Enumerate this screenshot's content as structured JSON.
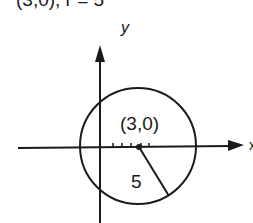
{
  "caption": "(3,0), r = 5",
  "axes": {
    "x_label": "x",
    "y_label": "y"
  },
  "circle": {
    "center_label": "(3,0)",
    "radius_label": "5",
    "center": [
      3,
      0
    ],
    "radius": 5
  },
  "colors": {
    "ink": "#1a1a1a",
    "background": "#ffffff"
  }
}
